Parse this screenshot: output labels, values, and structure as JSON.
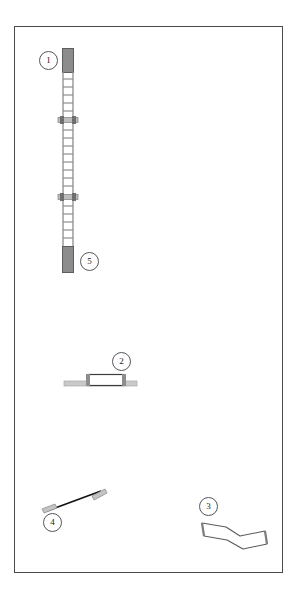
{
  "document": {
    "type": "technical-parts-diagram",
    "background_color": "#ffffff",
    "frame": {
      "border_color": "#4a4a4a",
      "x": 14,
      "y": 26,
      "width": 269,
      "height": 547
    }
  },
  "callouts": [
    {
      "id": "1",
      "label": "1",
      "x": 39,
      "y": 51,
      "refers_to": "vertical-ladder-mast"
    },
    {
      "id": "5",
      "label": "5",
      "x": 80,
      "y": 252,
      "refers_to": "mast-bottom-cap"
    },
    {
      "id": "2",
      "label": "2",
      "x": 112,
      "y": 352,
      "refers_to": "horizontal-rail-assembly"
    },
    {
      "id": "3",
      "label": "3",
      "x": 199,
      "y": 497,
      "refers_to": "cranked-flat-bar"
    },
    {
      "id": "4",
      "label": "4",
      "x": 43,
      "y": 513,
      "refers_to": "diagonal-tie-rod"
    }
  ],
  "parts": {
    "mast": {
      "name": "vertical-ladder-mast",
      "rail_color": "#9a9a9a",
      "rung_color": "#8e8e8e",
      "cap_color": "#8c8c8c",
      "cap_edge_color": "#5d5d5d",
      "left_rail_x": 62,
      "right_rail_x": 73,
      "top": 48,
      "bottom": 272,
      "top_cap": {
        "y": 48,
        "height": 24
      },
      "bottom_cap": {
        "y": 246,
        "height": 26
      },
      "rung_spacing": 8,
      "brackets": [
        {
          "y": 120,
          "width": 20,
          "color": "#7d7d7d"
        },
        {
          "y": 197,
          "width": 20,
          "color": "#7d7d7d"
        }
      ]
    },
    "rail": {
      "name": "horizontal-rail-assembly",
      "bar_color": "#c9c9c9",
      "bar_edge_color": "#9a9a9a",
      "block_fill": "#ffffff",
      "block_edge_color": "#3c3c3c",
      "bar": {
        "x": 64,
        "y": 381,
        "width": 73,
        "height": 5
      },
      "block": {
        "x": 88,
        "y": 374,
        "width": 35,
        "height": 11
      }
    },
    "cranked_bar": {
      "name": "cranked-flat-bar",
      "fill": "#ffffff",
      "edge_color": "#5a5a5a",
      "end_face_color": "#8a8a8a",
      "points": "202,523 226,527 240,536 265,531 267,544 243,549 227,540 204,536"
    },
    "tie_rod": {
      "name": "diagonal-tie-rod",
      "rod_color": "#111111",
      "end_color": "#c4c4c4",
      "end_edge_color": "#8d8d8d",
      "start": {
        "x": 44,
        "y": 512
      },
      "end": {
        "x": 104,
        "y": 490
      }
    }
  }
}
